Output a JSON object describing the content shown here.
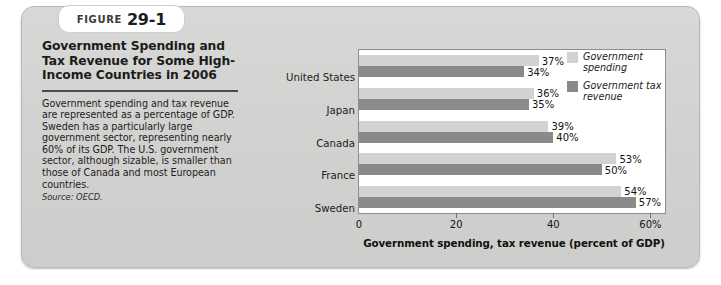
{
  "figure": {
    "badge_word": "Figure",
    "badge_number": "29-1",
    "title": "Government Spending and Tax Revenue for Some High-Income Countries in 2006",
    "body": "Government spending and tax revenue are represented as a percentage of GDP. Sweden has a particularly large government sector, representing nearly 60% of its GDP. The U.S. government sector, although sizable, is smaller than those of Canada and most European countries.",
    "source": "Source: OECD."
  },
  "chart_data": {
    "type": "bar",
    "orientation": "horizontal",
    "title": "Government Spending and Tax Revenue for Some High-Income Countries in 2006",
    "categories": [
      "United States",
      "Japan",
      "Canada",
      "France",
      "Sweden"
    ],
    "series": [
      {
        "name": "Government spending",
        "color": "#d2d2d2",
        "values": [
          37,
          36,
          39,
          53,
          54
        ],
        "labels": [
          "37%",
          "36%",
          "39%",
          "53%",
          "54%"
        ]
      },
      {
        "name": "Government tax revenue",
        "color": "#8a8a8a",
        "values": [
          34,
          35,
          40,
          50,
          57
        ],
        "labels": [
          "34%",
          "35%",
          "40%",
          "50%",
          "57%"
        ]
      }
    ],
    "xlabel": "Government spending, tax revenue (percent of GDP)",
    "ylabel": "",
    "xlim": [
      0,
      63
    ],
    "xticks": [
      0,
      20,
      40,
      60
    ],
    "xtick_labels": [
      "0",
      "20",
      "40",
      "60%"
    ],
    "grid": false,
    "legend_position": "top-right"
  }
}
